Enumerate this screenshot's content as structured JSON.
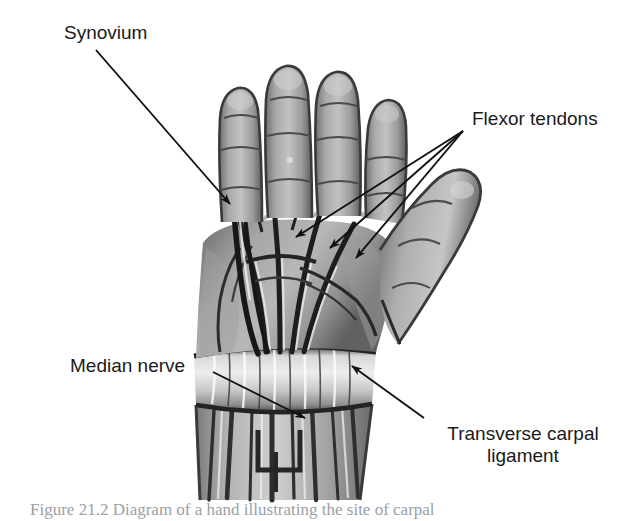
{
  "figure": {
    "type": "anatomical-illustration",
    "background_color": "#ffffff",
    "label_color": "#1a1a1a",
    "illustration_tone": "grayscale"
  },
  "labels": {
    "synovium": "Synovium",
    "flexor_tendons": "Flexor tendons",
    "median_nerve": "Median nerve",
    "transverse_carpal_ligament_line1": "Transverse carpal",
    "transverse_carpal_ligament_line2": "ligament"
  },
  "caption": {
    "text": "Figure 21.2 Diagram of a hand illustrating the site of carpal"
  },
  "anatomy": {
    "parts": [
      "index-finger",
      "middle-finger",
      "ring-finger",
      "little-finger",
      "thumb",
      "palm",
      "flexor-tendon-bundle",
      "synovial-sheath",
      "transverse-carpal-ligament",
      "median-nerve",
      "forearm-tendons"
    ]
  }
}
